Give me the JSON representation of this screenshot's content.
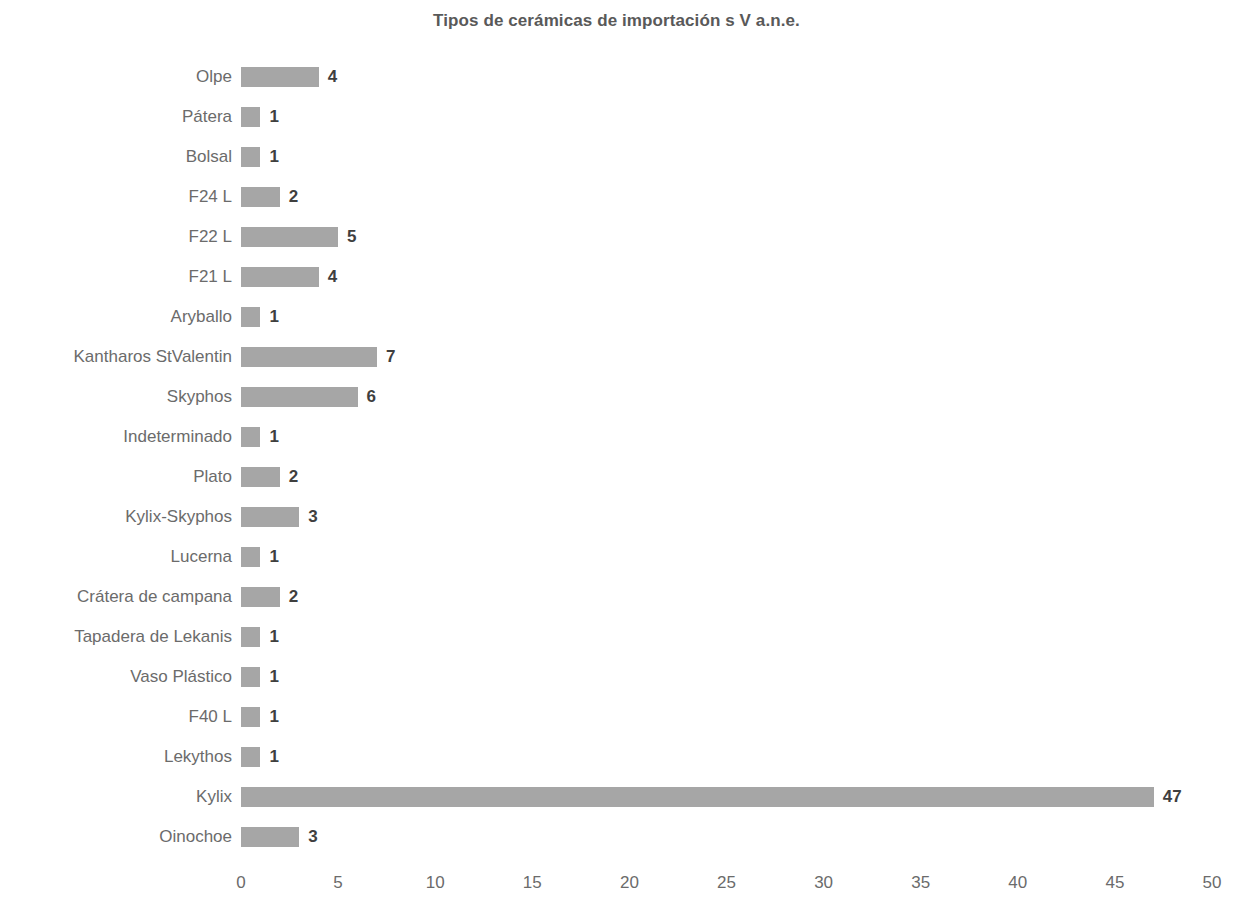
{
  "chart_data": {
    "type": "bar",
    "orientation": "horizontal",
    "title": "Tipos de cerámicas de importación s V a.n.e.",
    "xlabel": "",
    "ylabel": "",
    "xlim": [
      0,
      50
    ],
    "xticks": [
      0,
      5,
      10,
      15,
      20,
      25,
      30,
      35,
      40,
      45,
      50
    ],
    "grid": false,
    "legend": null,
    "bar_color": "#a6a6a6",
    "label_color": "#6b6b6b",
    "value_color": "#3f3f3f",
    "title_color": "#595959",
    "categories": [
      "Olpe",
      "Pátera",
      "Bolsal",
      "F24 L",
      "F22 L",
      "F21 L",
      "Aryballo",
      "Kantharos StValentin",
      "Skyphos",
      "Indeterminado",
      "Plato",
      "Kylix-Skyphos",
      "Lucerna",
      "Crátera de campana",
      "Tapadera de Lekanis",
      "Vaso Plástico",
      "F40 L",
      "Lekythos",
      "Kylix",
      "Oinochoe"
    ],
    "values": [
      4,
      1,
      1,
      2,
      5,
      4,
      1,
      7,
      6,
      1,
      2,
      3,
      1,
      2,
      1,
      1,
      1,
      1,
      47,
      3
    ],
    "value_labels": [
      "4",
      "1",
      "1",
      "2",
      "5",
      "4",
      "1",
      "7",
      "6",
      "1",
      "2",
      "3",
      "1",
      "2",
      "1",
      "1",
      "1",
      "1",
      "47",
      "3"
    ],
    "xtick_labels": [
      "0",
      "5",
      "10",
      "15",
      "20",
      "25",
      "30",
      "35",
      "40",
      "45",
      "50"
    ]
  }
}
